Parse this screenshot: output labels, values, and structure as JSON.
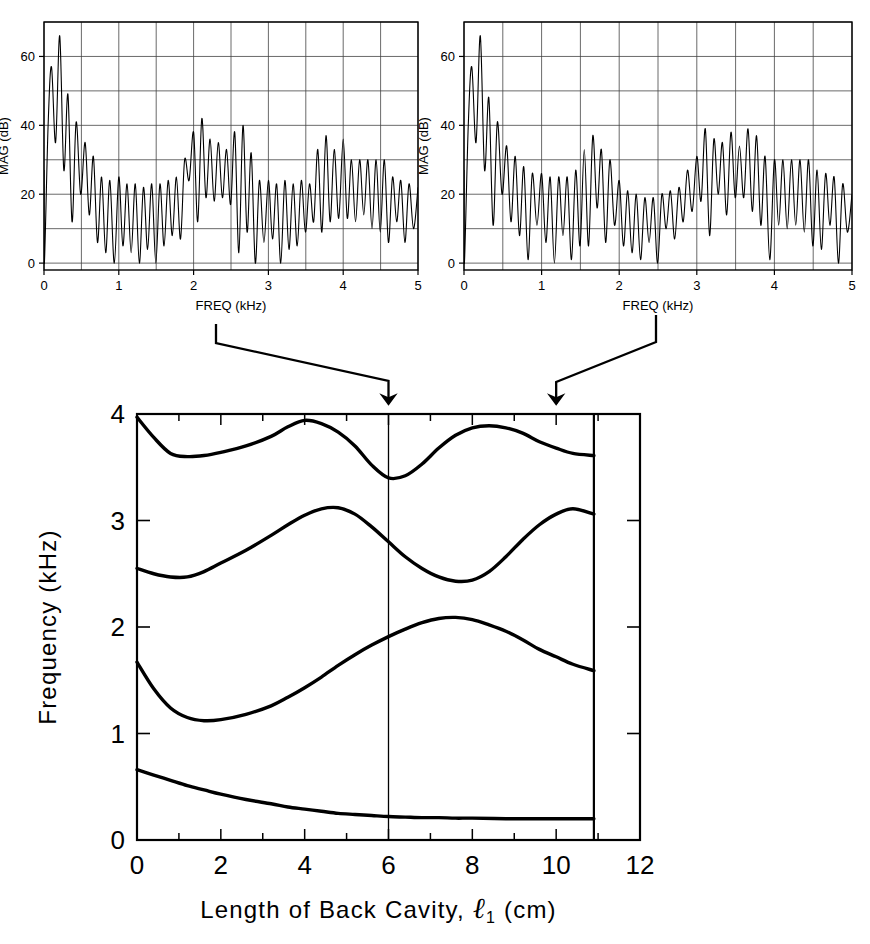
{
  "figure": {
    "title": "",
    "panels": [
      "spectrum-left",
      "spectrum-right",
      "formant-map"
    ]
  },
  "spectrum_left": {
    "xlabel": "FREQ (kHz)",
    "ylabel": "MAG  (dB)",
    "xticks": [
      "0",
      "1",
      "2",
      "3",
      "4",
      "5"
    ],
    "yticks": [
      "0",
      "20",
      "40",
      "60"
    ]
  },
  "spectrum_right": {
    "xlabel": "FREQ (kHz)",
    "ylabel": "MAG  (dB)",
    "xticks": [
      "0",
      "1",
      "2",
      "3",
      "4",
      "5"
    ],
    "yticks": [
      "0",
      "20",
      "40",
      "60"
    ]
  },
  "main": {
    "xlabel_pre": "Length of Back Cavity,",
    "xlabel_sym": "ℓ",
    "xlabel_sub": "1",
    "xlabel_post": "(cm)",
    "ylabel": "Frequency  (kHz)",
    "xticks": [
      "0",
      "2",
      "4",
      "6",
      "8",
      "10",
      "12"
    ],
    "yticks": [
      "0",
      "1",
      "2",
      "3",
      "4"
    ],
    "arrow_labels": [
      "6",
      "10"
    ]
  },
  "chart_data": [
    {
      "type": "line",
      "id": "spectrum-left",
      "title": "",
      "xlabel": "FREQ (kHz)",
      "ylabel": "MAG  (dB)",
      "xlim": [
        0,
        5
      ],
      "ylim": [
        -2,
        70
      ],
      "grid": true,
      "xticks": [
        0,
        1,
        2,
        3,
        4,
        5
      ],
      "yticks": [
        0,
        20,
        40,
        60
      ],
      "gridlines_x": [
        0,
        0.5,
        1,
        1.5,
        2,
        2.5,
        3,
        3.5,
        4,
        4.5,
        5
      ],
      "gridlines_y": [
        0,
        10,
        20,
        30,
        40,
        50,
        60,
        70
      ],
      "series": [
        {
          "name": "harmonic spectrum, back cavity 6 cm",
          "comment": "peak (kHz, dB) / trough values alternating along frequency; F1 near 0.2, F2 near 2.1-2.6, F3 near 3.8-4.0",
          "peaks_khz": [
            0.1,
            0.21,
            0.32,
            0.43,
            0.55,
            0.66,
            0.77,
            0.88,
            1.0,
            1.11,
            1.22,
            1.33,
            1.44,
            1.55,
            1.66,
            1.77,
            1.88,
            2.0,
            2.11,
            2.22,
            2.33,
            2.44,
            2.55,
            2.66,
            2.77,
            2.88,
            3.0,
            3.11,
            3.22,
            3.33,
            3.44,
            3.55,
            3.66,
            3.77,
            3.88,
            4.0,
            4.11,
            4.22,
            4.33,
            4.44,
            4.55,
            4.66,
            4.77,
            4.88,
            5.0
          ],
          "peaks_db": [
            57,
            66,
            49,
            41,
            35,
            31,
            25,
            24,
            25,
            23,
            23,
            22,
            23,
            23,
            24,
            25,
            30,
            38,
            42,
            36,
            35,
            33,
            38,
            40,
            32,
            24,
            24,
            23,
            24,
            23,
            24,
            23,
            33,
            37,
            33,
            36,
            30,
            30,
            30,
            30,
            30,
            25,
            24,
            23,
            22
          ],
          "troughs_db": [
            40,
            35,
            27,
            12,
            20,
            14,
            6,
            3,
            0,
            5,
            3,
            0,
            4,
            0,
            5,
            8,
            7,
            24,
            12,
            19,
            18,
            19,
            17,
            3,
            9,
            0,
            6,
            7,
            0,
            4,
            5,
            9,
            12,
            9,
            12,
            13,
            13,
            12,
            14,
            10,
            9,
            6,
            12,
            6,
            10
          ]
        }
      ]
    },
    {
      "type": "line",
      "id": "spectrum-right",
      "title": "",
      "xlabel": "FREQ (kHz)",
      "ylabel": "MAG  (dB)",
      "xlim": [
        0,
        5
      ],
      "ylim": [
        -2,
        70
      ],
      "grid": true,
      "xticks": [
        0,
        1,
        2,
        3,
        4,
        5
      ],
      "yticks": [
        0,
        20,
        40,
        60
      ],
      "gridlines_x": [
        0,
        0.5,
        1,
        1.5,
        2,
        2.5,
        3,
        3.5,
        4,
        4.5,
        5
      ],
      "gridlines_y": [
        0,
        10,
        20,
        30,
        40,
        50,
        60,
        70
      ],
      "series": [
        {
          "name": "harmonic spectrum, back cavity 10 cm",
          "comment": "F1 near 0.2, F2 near 1.7, F3 near 3.1-3.6",
          "peaks_khz": [
            0.1,
            0.21,
            0.32,
            0.43,
            0.55,
            0.66,
            0.77,
            0.88,
            1.0,
            1.11,
            1.22,
            1.33,
            1.44,
            1.55,
            1.66,
            1.77,
            1.88,
            2.0,
            2.11,
            2.22,
            2.33,
            2.44,
            2.55,
            2.66,
            2.77,
            2.88,
            3.0,
            3.11,
            3.22,
            3.33,
            3.44,
            3.55,
            3.66,
            3.77,
            3.88,
            4.0,
            4.11,
            4.22,
            4.33,
            4.44,
            4.55,
            4.66,
            4.77,
            4.88,
            5.0
          ],
          "peaks_db": [
            57,
            66,
            48,
            41,
            34,
            31,
            28,
            26,
            26,
            25,
            25,
            25,
            27,
            33,
            37,
            33,
            30,
            24,
            21,
            20,
            19,
            19,
            20,
            21,
            22,
            27,
            31,
            39,
            36,
            35,
            38,
            34,
            39,
            37,
            31,
            30,
            30,
            30,
            30,
            30,
            27,
            26,
            25,
            23,
            20
          ],
          "troughs_db": [
            40,
            35,
            27,
            11,
            20,
            12,
            8,
            1,
            11,
            6,
            0,
            8,
            1,
            5,
            5,
            16,
            6,
            11,
            5,
            3,
            1,
            6,
            0,
            10,
            7,
            12,
            15,
            18,
            8,
            20,
            14,
            19,
            19,
            15,
            11,
            1,
            11,
            10,
            11,
            9,
            5,
            4,
            11,
            0,
            9
          ]
        }
      ]
    },
    {
      "type": "line",
      "id": "formant-map",
      "title": "",
      "xlabel": "Length of Back Cavity, ℓ1 (cm)",
      "ylabel": "Frequency  (kHz)",
      "xlim": [
        0,
        12
      ],
      "ylim": [
        0,
        4
      ],
      "grid": false,
      "xticks": [
        0,
        2,
        4,
        6,
        8,
        10,
        12
      ],
      "yticks": [
        0,
        1,
        2,
        3,
        4
      ],
      "minor_xticks": [
        1,
        3,
        5,
        7,
        9,
        11
      ],
      "vertical_marker_x": 6,
      "data_end_x": 10.9,
      "annotations": [
        {
          "label": "arrow from left spectrum",
          "x": 6.0,
          "y": 4.0
        },
        {
          "label": "arrow from right spectrum",
          "x": 10.0,
          "y": 4.0
        }
      ],
      "series": [
        {
          "name": "F4",
          "x": [
            0,
            0.4,
            0.8,
            1.2,
            1.6,
            2.0,
            2.6,
            3.2,
            3.6,
            4.0,
            4.4,
            4.8,
            5.2,
            5.6,
            6.0,
            6.4,
            6.8,
            7.2,
            7.6,
            8.0,
            8.4,
            8.8,
            9.2,
            9.6,
            10.0,
            10.4,
            10.9
          ],
          "y": [
            3.97,
            3.78,
            3.63,
            3.6,
            3.61,
            3.64,
            3.7,
            3.79,
            3.88,
            3.94,
            3.91,
            3.83,
            3.7,
            3.52,
            3.4,
            3.42,
            3.53,
            3.68,
            3.8,
            3.87,
            3.89,
            3.87,
            3.82,
            3.74,
            3.68,
            3.63,
            3.61
          ]
        },
        {
          "name": "F3",
          "x": [
            0,
            0.4,
            0.8,
            1.2,
            1.6,
            2.0,
            2.6,
            3.2,
            3.6,
            4.0,
            4.4,
            4.8,
            5.2,
            5.6,
            6.0,
            6.4,
            6.8,
            7.2,
            7.6,
            8.0,
            8.4,
            8.8,
            9.2,
            9.6,
            10.0,
            10.4,
            10.9
          ],
          "y": [
            2.55,
            2.5,
            2.47,
            2.47,
            2.52,
            2.6,
            2.72,
            2.86,
            2.96,
            3.05,
            3.11,
            3.12,
            3.06,
            2.94,
            2.8,
            2.66,
            2.55,
            2.47,
            2.43,
            2.44,
            2.52,
            2.66,
            2.82,
            2.96,
            3.06,
            3.11,
            3.06
          ]
        },
        {
          "name": "F2",
          "x": [
            0,
            0.4,
            0.8,
            1.2,
            1.6,
            2.0,
            2.6,
            3.2,
            3.6,
            4.0,
            4.4,
            4.8,
            5.2,
            5.6,
            6.0,
            6.4,
            6.8,
            7.2,
            7.6,
            8.0,
            8.4,
            8.8,
            9.2,
            9.6,
            10.0,
            10.4,
            10.9
          ],
          "y": [
            1.67,
            1.42,
            1.24,
            1.15,
            1.12,
            1.13,
            1.18,
            1.26,
            1.34,
            1.43,
            1.53,
            1.64,
            1.74,
            1.83,
            1.91,
            1.98,
            2.04,
            2.08,
            2.09,
            2.07,
            2.02,
            1.96,
            1.88,
            1.79,
            1.72,
            1.65,
            1.59
          ]
        },
        {
          "name": "F1",
          "x": [
            0,
            0.4,
            0.8,
            1.2,
            1.6,
            2.0,
            2.6,
            3.2,
            3.6,
            4.0,
            4.4,
            4.8,
            5.2,
            5.6,
            6.0,
            6.4,
            6.8,
            7.2,
            7.6,
            8.0,
            8.8,
            9.6,
            10.4,
            10.9
          ],
          "y": [
            0.66,
            0.61,
            0.56,
            0.51,
            0.47,
            0.43,
            0.38,
            0.34,
            0.31,
            0.29,
            0.27,
            0.25,
            0.24,
            0.23,
            0.22,
            0.215,
            0.21,
            0.21,
            0.205,
            0.205,
            0.2,
            0.2,
            0.2,
            0.2
          ]
        }
      ]
    }
  ]
}
